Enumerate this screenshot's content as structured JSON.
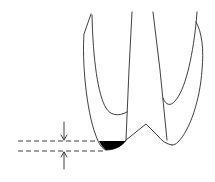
{
  "diagram": {
    "type": "line-drawing",
    "colors": {
      "line": "#2a2a2a",
      "fill": "#000000",
      "background": "#ffffff"
    },
    "elements": [
      "left-cusp-outline",
      "left-pulp-wall",
      "central-groove-line",
      "right-cusp-outline",
      "right-pulp-wall",
      "shaded-cusp-tip",
      "upper-dashed-reference-line",
      "lower-dashed-reference-line",
      "down-arrow",
      "up-arrow"
    ]
  }
}
